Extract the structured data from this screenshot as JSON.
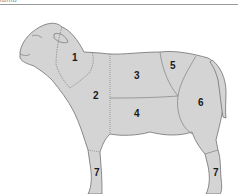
{
  "header": {
    "caption": "lamb"
  },
  "diagram": {
    "fill_color": "#d4d4d4",
    "outline_color": "#707070",
    "labels": [
      {
        "id": "1",
        "text": "1",
        "x": 72,
        "y": 61
      },
      {
        "id": "2",
        "text": "2",
        "x": 94,
        "y": 99
      },
      {
        "id": "3",
        "text": "3",
        "x": 137,
        "y": 79
      },
      {
        "id": "4",
        "text": "4",
        "x": 137,
        "y": 117
      },
      {
        "id": "5",
        "text": "5",
        "x": 173,
        "y": 69
      },
      {
        "id": "6",
        "text": "6",
        "x": 201,
        "y": 106
      },
      {
        "id": "7a",
        "text": "7",
        "x": 97,
        "y": 176
      },
      {
        "id": "7b",
        "text": "7",
        "x": 216,
        "y": 176
      }
    ]
  }
}
